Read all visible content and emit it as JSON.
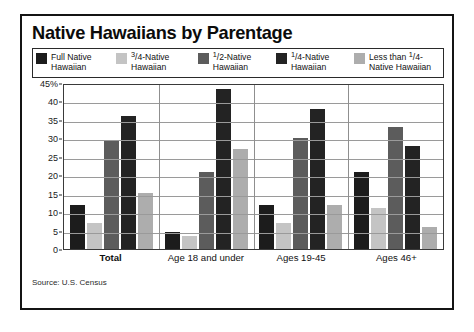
{
  "title": "Native Hawaiians by Parentage",
  "source": "Source: U.S. Census",
  "legend": [
    {
      "name": "full-native",
      "line1_pre": "",
      "line1_frac_num": "",
      "line1_frac_den": "",
      "line1": "Full Native",
      "line2": "Hawaiian",
      "color": "#1c1c1c"
    },
    {
      "name": "three-quarter-native",
      "line1_pre": "",
      "line1_frac_num": "3",
      "line1_frac_den": "4",
      "line1_post": "-Native",
      "line2": "Hawaiian",
      "color": "#c4c4c4"
    },
    {
      "name": "half-native",
      "line1_pre": "",
      "line1_frac_num": "1",
      "line1_frac_den": "2",
      "line1_post": "-Native",
      "line2": "Hawaiian",
      "color": "#5c5c5c"
    },
    {
      "name": "quarter-native",
      "line1_pre": "",
      "line1_frac_num": "1",
      "line1_frac_den": "4",
      "line1_post": "-Native",
      "line2": "Hawaiian",
      "color": "#232323"
    },
    {
      "name": "less-than-quarter-native",
      "line1_pre": "Less than ",
      "line1_frac_num": "1",
      "line1_frac_den": "4",
      "line1_post": "-",
      "line2": "Native Hawaiian",
      "color": "#adadad"
    }
  ],
  "yticks": [
    "45%",
    "40",
    "35",
    "30",
    "25",
    "20",
    "15",
    "10",
    "5",
    "0"
  ],
  "chart_data": {
    "type": "bar",
    "title": "Native Hawaiians by Parentage",
    "subtitle": "",
    "xlabel": "",
    "ylabel": "",
    "ylim": [
      0,
      45
    ],
    "ytick_values": [
      0,
      5,
      10,
      15,
      20,
      25,
      30,
      35,
      40,
      45
    ],
    "grid": true,
    "legend_position": "top",
    "categories": [
      "Total",
      "Age 18 and under",
      "Ages 19-45",
      "Ages 46+"
    ],
    "series": [
      {
        "name": "Full Native Hawaiian",
        "color": "#1c1c1c",
        "values": [
          12,
          4.7,
          12,
          21
        ]
      },
      {
        "name": "3/4-Native Hawaiian",
        "color": "#c4c4c4",
        "values": [
          7,
          3.5,
          7,
          11
        ]
      },
      {
        "name": "1/2-Native Hawaiian",
        "color": "#5c5c5c",
        "values": [
          29.5,
          21,
          30,
          33
        ]
      },
      {
        "name": "1/4-Native Hawaiian",
        "color": "#232323",
        "values": [
          36,
          43.5,
          38,
          28
        ]
      },
      {
        "name": "Less than 1/4-Native Hawaiian",
        "color": "#adadad",
        "values": [
          15.3,
          27,
          12,
          6
        ]
      }
    ],
    "source": "Source: U.S. Census"
  }
}
